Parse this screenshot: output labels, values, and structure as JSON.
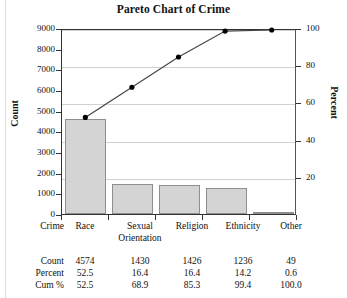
{
  "chart_data": {
    "type": "bar",
    "title": "Pareto Chart of Crime",
    "xlabel": "Crime",
    "ylabel": "Count",
    "y2label": "Percent",
    "categories": [
      "Race",
      "Sexual Orientation",
      "Religion",
      "Ethnicity",
      "Other"
    ],
    "values": [
      4574,
      1430,
      1426,
      1236,
      49
    ],
    "percent": [
      52.5,
      16.4,
      16.4,
      14.2,
      0.6
    ],
    "cumulative": [
      52.5,
      68.9,
      85.3,
      99.4,
      100.0
    ],
    "ylim": [
      0,
      9000
    ],
    "yticks": [
      0,
      1000,
      2000,
      3000,
      4000,
      5000,
      6000,
      7000,
      8000,
      9000
    ],
    "y2lim": [
      0,
      100
    ],
    "y2ticks": [
      20,
      40,
      60,
      80,
      100
    ],
    "grid": true,
    "legend": "none",
    "bar_color": "#d4d4d4",
    "bar_border_color": "#8e8e8e",
    "line_color": "#444444",
    "marker_color": "#000000"
  },
  "table": {
    "row_labels": [
      "Crime",
      "Count",
      "Percent",
      "Cum %"
    ],
    "columns": [
      {
        "crime": "Race",
        "crime2": "",
        "count": "4574",
        "percent": "52.5",
        "cum": "52.5"
      },
      {
        "crime": "Sexual",
        "crime2": "Orientation",
        "count": "1430",
        "percent": "16.4",
        "cum": "68.9"
      },
      {
        "crime": "Religion",
        "crime2": "",
        "count": "1426",
        "percent": "16.4",
        "cum": "85.3"
      },
      {
        "crime": "Ethnicity",
        "crime2": "",
        "count": "1236",
        "percent": "14.2",
        "cum": "99.4"
      },
      {
        "crime": "Other",
        "crime2": "",
        "count": "49",
        "percent": "0.6",
        "cum": "100.0"
      }
    ]
  },
  "axes": {
    "left_ticks": [
      "9000",
      "8000",
      "7000",
      "6000",
      "5000",
      "4000",
      "3000",
      "2000",
      "1000",
      "0"
    ],
    "right_ticks": [
      "100",
      "80",
      "60",
      "40",
      "20"
    ]
  }
}
